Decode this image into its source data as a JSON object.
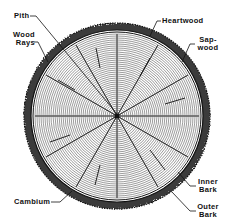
{
  "diagram": {
    "colors": {
      "ink": "#111111",
      "background": "#ffffff",
      "bark": "#3a3a3a"
    },
    "labels": {
      "pith": "Pith",
      "wood_rays": "Wood\nRays",
      "heartwood": "Heartwood",
      "sapwood": "Sap-\nwood",
      "inner_bark": "Inner\nBark",
      "outer_bark": "Outer\nBark",
      "cambium": "Cambium"
    }
  }
}
